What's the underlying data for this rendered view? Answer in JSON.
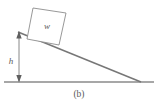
{
  "figure": {
    "caption": "(b)",
    "labels": {
      "block_weight": "w",
      "height": "h"
    },
    "colors": {
      "stroke": "#6f6f6f",
      "ground": "#8a8a8a",
      "incline": "#777777",
      "block_fill": "#ffffff",
      "arrow": "#5f5f5f",
      "text": "#5a5a5a",
      "background": "#ffffff"
    },
    "geometry": {
      "ground_line": {
        "x1": 4,
        "y1": 82,
        "x2": 154,
        "y2": 82
      },
      "incline_line": {
        "x1": 18,
        "y1": 32,
        "x2": 141,
        "y2": 82
      },
      "height_dimension": {
        "x": 19,
        "y_top": 33,
        "y_bottom": 81
      },
      "block_corners": [
        {
          "x": 33,
          "y": 8
        },
        {
          "x": 66,
          "y": 13
        },
        {
          "x": 59,
          "y": 45
        },
        {
          "x": 27,
          "y": 39
        }
      ],
      "label_w_position": {
        "x": 47,
        "y": 29
      },
      "label_h_position": {
        "x": 11,
        "y": 61
      }
    }
  }
}
